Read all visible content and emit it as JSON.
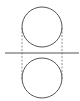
{
  "diagram": {
    "colors": {
      "stroke": "#555555",
      "dashed": "#777777",
      "background": "#ffffff"
    },
    "elements": [
      {
        "id": "top-circle",
        "type": "circle"
      },
      {
        "id": "bottom-circle",
        "type": "circle"
      },
      {
        "id": "horizontal-line",
        "type": "line"
      },
      {
        "id": "left-dashed-line",
        "type": "dashed-line"
      },
      {
        "id": "right-dashed-line",
        "type": "dashed-line"
      }
    ]
  }
}
